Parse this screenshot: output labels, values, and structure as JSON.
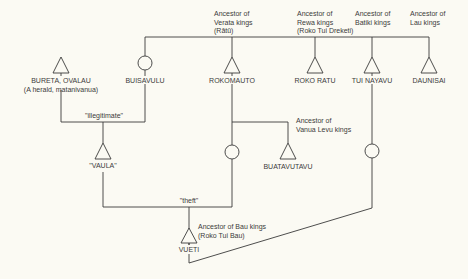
{
  "diagram": {
    "type": "genealogy",
    "people": [
      {
        "id": "bureta",
        "name": "BURETA, OVALAU",
        "sub": "(A herald, matanivanua)",
        "sex": "male"
      },
      {
        "id": "buisavulu",
        "name": "BUISAVULU",
        "sex": "female"
      },
      {
        "id": "rokomauto",
        "name": "ROKOMAUTO",
        "sex": "male",
        "note": [
          "Ancestor of",
          "Verata kings",
          "(Rātū)"
        ]
      },
      {
        "id": "rokoratu",
        "name": "ROKO RATU",
        "sex": "male",
        "note": [
          "Ancestor of",
          "Rewa kings",
          "(Roko Tui Dreketi)"
        ]
      },
      {
        "id": "tuinayavu",
        "name": "TUI NAYAVU",
        "sex": "male",
        "note": [
          "Ancestor of",
          "Batiki kings"
        ]
      },
      {
        "id": "daunisai",
        "name": "DAUNISAI",
        "sex": "male",
        "note": [
          "Ancestor of",
          "Lau kings"
        ]
      },
      {
        "id": "vaula",
        "name": "\"VAULA\"",
        "sex": "male"
      },
      {
        "id": "buatavutavu",
        "name": "BUATAVUTAVU",
        "sex": "male",
        "note": [
          "Ancestor of",
          "Vanua Levu kings"
        ]
      },
      {
        "id": "rokomauto_daughter",
        "name": "",
        "sex": "female"
      },
      {
        "id": "tuinayavu_daughter",
        "name": "",
        "sex": "female"
      },
      {
        "id": "vueti",
        "name": "VUETI",
        "sex": "male",
        "note": [
          "Ancestor of Bau kings",
          "(Roko Tui Bau)"
        ]
      }
    ],
    "relations": [
      {
        "label": "\"illegitimate\"",
        "between": [
          "bureta",
          "buisavulu"
        ],
        "child": "vaula"
      },
      {
        "label": "\"theft\"",
        "between": [
          "vaula",
          "rokomauto_daughter"
        ],
        "child": "vueti"
      }
    ]
  }
}
